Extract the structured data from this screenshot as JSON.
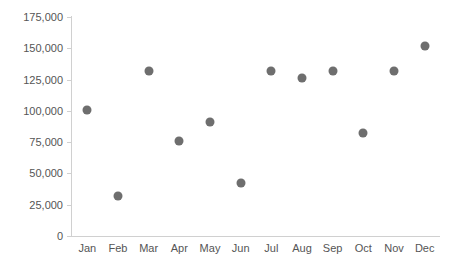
{
  "chart_data": {
    "type": "scatter",
    "title": "",
    "xlabel": "",
    "ylabel": "",
    "categories": [
      "Jan",
      "Feb",
      "Mar",
      "Apr",
      "May",
      "Jun",
      "Jul",
      "Aug",
      "Sep",
      "Oct",
      "Nov",
      "Dec"
    ],
    "values": [
      101000,
      32000,
      132000,
      76000,
      91000,
      42000,
      132000,
      126000,
      132000,
      82000,
      132000,
      152000
    ],
    "ylim": [
      0,
      175000
    ],
    "yticks": [
      0,
      25000,
      50000,
      75000,
      100000,
      125000,
      150000,
      175000
    ],
    "ytick_labels": [
      "0",
      "25,000",
      "50,000",
      "75,000",
      "100,000",
      "125,000",
      "150,000",
      "175,000"
    ],
    "grid": false,
    "legend": false,
    "marker_color": "#6e6e6e",
    "axis_color": "#d0d0d0",
    "tick_label_color": "#555555"
  }
}
